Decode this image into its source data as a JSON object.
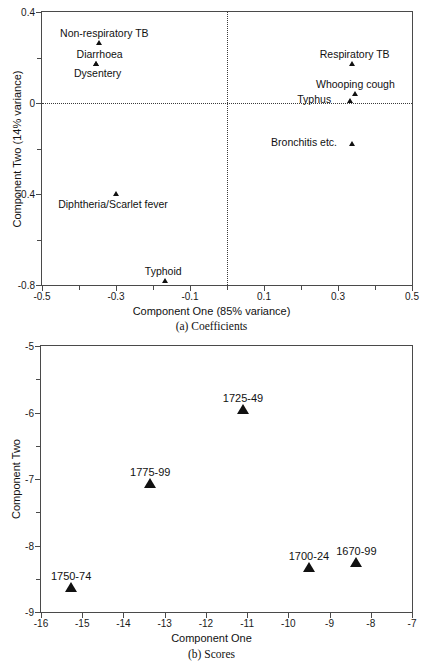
{
  "chart_data": [
    {
      "type": "scatter",
      "id": "coefficients",
      "title": "",
      "caption": "(a) Coefficients",
      "xlabel": "Component One (85% variance)",
      "ylabel": "Component Two (14% variance)",
      "xlim": [
        -0.5,
        0.5
      ],
      "ylim": [
        -0.8,
        0.4
      ],
      "xticks": [
        "-0.5",
        "-0.3",
        "-0.1",
        "0.1",
        "0.3",
        "0.5"
      ],
      "xtick_values": [
        -0.5,
        -0.3,
        -0.1,
        0.1,
        0.3,
        0.5
      ],
      "xminor_values": [
        -0.4,
        -0.2,
        0.0,
        0.2,
        0.4
      ],
      "yticks": [
        "0.4",
        "0",
        "-0.4",
        "-0.8"
      ],
      "ytick_values": [
        0.4,
        0.0,
        -0.4,
        -0.8
      ],
      "yminor_values": [
        0.2,
        -0.2,
        -0.6
      ],
      "grid": false,
      "legend": "none",
      "reference_lines": {
        "vertical_x": 0.0,
        "horizontal_y": 0.0,
        "style": "dotted"
      },
      "points": [
        {
          "label": "Non-respiratory TB",
          "x": -0.345,
          "y": 0.255,
          "label_dx": 5,
          "label_dy": -6
        },
        {
          "label": "Diarrhoea",
          "x": -0.355,
          "y": 0.163,
          "label_dx": 4,
          "label_dy": -6
        },
        {
          "label": "Dysentery",
          "x": -0.355,
          "y": 0.163,
          "label_dx": 2,
          "label_dy": 13
        },
        {
          "label": "Respiratory TB",
          "x": 0.337,
          "y": 0.162,
          "label_dx": 3,
          "label_dy": -6
        },
        {
          "label": "Whooping cough",
          "x": 0.347,
          "y": 0.03,
          "label_dx": 0,
          "label_dy": -6
        },
        {
          "label": "Typhus",
          "x": 0.333,
          "y": 0.0,
          "label_dx": -36,
          "label_dy": 2
        },
        {
          "label": "Bronchitis etc.",
          "x": 0.338,
          "y": -0.188,
          "label_dx": -48,
          "label_dy": 2
        },
        {
          "label": "Diphtheria/Scarlet fever",
          "x": -0.3,
          "y": -0.408,
          "label_dx": -3,
          "label_dy": 14
        },
        {
          "label": "Typhoid",
          "x": -0.167,
          "y": -0.79,
          "label_dx": -2,
          "label_dy": -6
        }
      ]
    },
    {
      "type": "scatter",
      "id": "scores",
      "title": "",
      "caption": "(b) Scores",
      "xlabel": "Component One",
      "ylabel": "Component Two",
      "xlim": [
        -16,
        -7
      ],
      "ylim": [
        -9,
        -5
      ],
      "xticks": [
        "-16",
        "-15",
        "-14",
        "-13",
        "-12",
        "-11",
        "-10",
        "-9",
        "-8",
        "-7"
      ],
      "xtick_values": [
        -16,
        -15,
        -14,
        -13,
        -12,
        -11,
        -10,
        -9,
        -8,
        -7
      ],
      "yticks": [
        "-5",
        "-6",
        "-7",
        "-8",
        "-9"
      ],
      "ytick_values": [
        -5,
        -6,
        -7,
        -8,
        -9
      ],
      "yminor_values": [
        -5.5,
        -6.5,
        -7.5,
        -8.5
      ],
      "grid": false,
      "legend": "none",
      "points": [
        {
          "label": "1725-49",
          "x": -11.1,
          "y": -6.03,
          "label_dx": 0,
          "label_dy": -10
        },
        {
          "label": "1775-99",
          "x": -13.35,
          "y": -7.14,
          "label_dx": 0,
          "label_dy": -10
        },
        {
          "label": "1700-24",
          "x": -9.5,
          "y": -8.4,
          "label_dx": 0,
          "label_dy": -10
        },
        {
          "label": "1670-99",
          "x": -8.35,
          "y": -8.33,
          "label_dx": 0,
          "label_dy": -10
        },
        {
          "label": "1750-74",
          "x": -15.27,
          "y": -8.7,
          "label_dx": 0,
          "label_dy": -10
        }
      ]
    }
  ]
}
